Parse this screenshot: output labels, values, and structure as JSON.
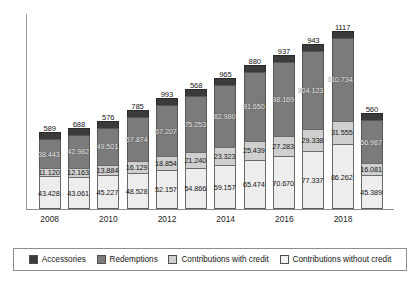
{
  "chart_data": {
    "type": "bar",
    "stacked": true,
    "title": "",
    "subtitle": "",
    "xlabel": "",
    "ylabel": "",
    "grid": false,
    "legend_position": "bottom",
    "ylim": [
      0,
      260
    ],
    "categories": [
      "2008",
      "2009",
      "2010",
      "2011",
      "2012",
      "2013",
      "2014",
      "2015",
      "2016",
      "2017",
      "2018",
      "2019"
    ],
    "xtick_labels": [
      "2008",
      "2010",
      "2012",
      "2014",
      "2016",
      "2018"
    ],
    "xtick_categories": [
      "2008",
      "2010",
      "2012",
      "2014",
      "2016",
      "2018"
    ],
    "series": [
      {
        "name": "Contributions without credit",
        "color": "#ededed",
        "values": [
          43.428,
          43.061,
          45.227,
          48.528,
          52.157,
          54.866,
          59.157,
          65.474,
          70.67,
          77.337,
          86.262,
          45.389
        ],
        "labels": [
          "43.428",
          "43.061",
          "45.227",
          "48.528",
          "52.157",
          "54.866",
          "59.157",
          "65.474",
          "70.670",
          "77.337",
          "86.262",
          "45.389"
        ]
      },
      {
        "name": "Contributions with credit",
        "color": "#cfcfcf",
        "values": [
          11.12,
          12.163,
          13.884,
          16.129,
          18.854,
          21.24,
          23.323,
          25.439,
          27.283,
          29.338,
          31.555,
          16.081
        ],
        "labels": [
          "11.120",
          "12.163",
          "13.884",
          "16.129",
          "18.854",
          "21.240",
          "23.323",
          "25.439",
          "27.283",
          "29.338",
          "31.555",
          "16.081"
        ]
      },
      {
        "name": "Redemptions",
        "color": "#7b7b7b",
        "values": [
          38.443,
          42.982,
          49.501,
          57.874,
          67.207,
          75.253,
          82.98,
          91.65,
          98.169,
          104.123,
          110.734,
          56.987
        ],
        "labels": [
          "38.443",
          "42.982",
          "49.501",
          "57.874",
          "67.207",
          "75.253",
          "82.980",
          "91.650",
          "98.169",
          "104.123",
          "110.734",
          "56.987"
        ]
      },
      {
        "name": "Accessories",
        "color": "#3b3b3b",
        "values": [
          0.589,
          0.688,
          0.576,
          0.785,
          0.993,
          0.568,
          0.965,
          0.88,
          0.937,
          0.943,
          1.117,
          0.56
        ],
        "labels": [
          "589",
          "688",
          "576",
          "785",
          "993",
          "568",
          "965",
          "880",
          "937",
          "943",
          "1117",
          "560"
        ]
      }
    ]
  },
  "legend": {
    "items": [
      {
        "label": "Accessories",
        "swatch": "accessories-swatch"
      },
      {
        "label": "Redemptions",
        "swatch": "redemptions-swatch"
      },
      {
        "label": "Contributions with credit",
        "swatch": "contributions-with-credit-swatch"
      },
      {
        "label": "Contributions without credit",
        "swatch": "contributions-without-credit-swatch"
      }
    ]
  }
}
